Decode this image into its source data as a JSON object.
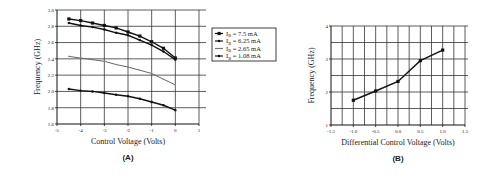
{
  "chart_data": [
    {
      "panel": "(A)",
      "type": "line",
      "title": "",
      "xlabel": "Control Voltage (Volts)",
      "ylabel": "Frequency (GHz)",
      "xlim": [
        -5,
        1
      ],
      "ylim": [
        1.6,
        3.0
      ],
      "xticks": [
        "-5",
        "-4",
        "-3",
        "-2",
        "-1",
        "0",
        "1"
      ],
      "yticks": [
        "1.6",
        "1.8",
        "2.0",
        "2.2",
        "2.4",
        "2.6",
        "2.8",
        "3.0"
      ],
      "grid": true,
      "legend_position": "right",
      "x": [
        -4.5,
        -4,
        -3.5,
        -3,
        -2.5,
        -2,
        -1.5,
        -1,
        -0.5,
        0
      ],
      "series": [
        {
          "name": "I_B = 7.5 mA",
          "label_main": "I",
          "label_sub": "B",
          "label_rest": " = 7.5 mA",
          "marker": "square",
          "values": [
            2.89,
            2.87,
            2.84,
            2.81,
            2.78,
            2.73,
            2.68,
            2.61,
            2.53,
            2.41
          ]
        },
        {
          "name": "I_B = 6.25 mA",
          "label_main": "I",
          "label_sub": "B",
          "label_rest": " = 6.25 mA",
          "marker": "plus",
          "values": [
            2.84,
            2.81,
            2.79,
            2.76,
            2.72,
            2.69,
            2.63,
            2.57,
            2.49,
            2.39
          ]
        },
        {
          "name": "I_B = 2.65 mA",
          "label_main": "I",
          "label_sub": "B",
          "label_rest": " = 2.65 mA",
          "marker": "open",
          "values": [
            2.43,
            2.41,
            2.39,
            2.37,
            2.33,
            2.3,
            2.26,
            2.22,
            2.15,
            2.08
          ]
        },
        {
          "name": "I_B = 1.08 mA",
          "label_main": "I",
          "label_sub": "B",
          "label_rest": " = 1.08 mA",
          "marker": "plus",
          "values": [
            2.03,
            2.01,
            2.0,
            1.98,
            1.96,
            1.94,
            1.91,
            1.87,
            1.83,
            1.77
          ]
        }
      ],
      "caption": "(A)"
    },
    {
      "panel": "(B)",
      "type": "line",
      "title": "",
      "xlabel": "Differential Control Voltage (Volts)",
      "ylabel": "Frequency (GHz)",
      "xlim": [
        -1.5,
        1.5
      ],
      "ylim": [
        1,
        4
      ],
      "xticks": [
        "-1.5",
        "-1.0",
        "-0.5",
        "0.0",
        "0.5",
        "1.0",
        "1.5"
      ],
      "yticks": [
        "1",
        "2",
        "3",
        "4"
      ],
      "grid": true,
      "x": [
        -1.0,
        -0.5,
        0.0,
        0.5,
        1.0
      ],
      "series": [
        {
          "name": "Frequency",
          "values": [
            1.75,
            2.03,
            2.32,
            2.95,
            3.27
          ]
        }
      ],
      "caption": "(B)"
    }
  ]
}
